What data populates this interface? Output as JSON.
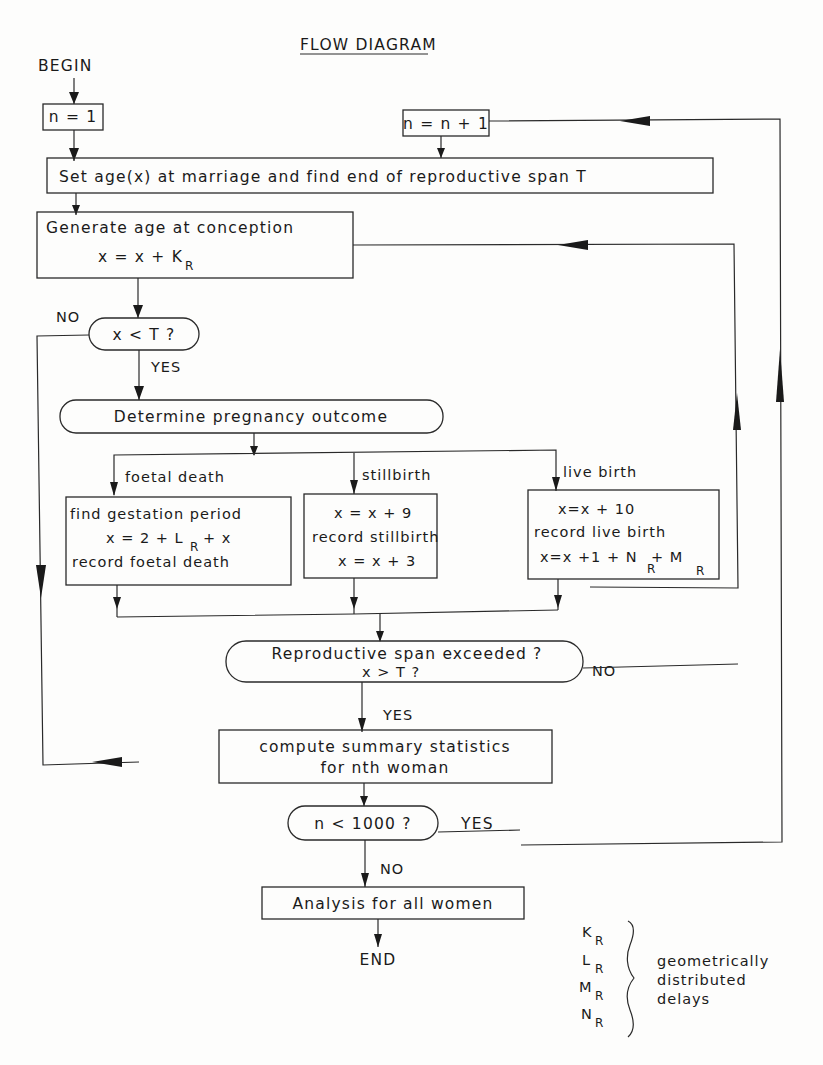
{
  "title": "FLOW DIAGRAM",
  "begin": "BEGIN",
  "end": "END",
  "nodes": {
    "init_n": "n = 1",
    "increment_n": "n = n + 1",
    "set_age": "Set age(x) at marriage and find end of reproductive span T",
    "generate_age": {
      "line1": "Generate age at conception",
      "line2": "x = x + K",
      "line2_sub": "R"
    },
    "decision_x_lt_T": "x < T ?",
    "determine_outcome": "Determine pregnancy outcome",
    "foetal_death_box": {
      "line1": "find gestation period",
      "line2a": "x = 2 + L",
      "line2_sub": "R",
      "line2b": "+ x",
      "line3": "record foetal death"
    },
    "stillbirth_box": {
      "line1": "x = x + 9",
      "line2": "record stillbirth",
      "line3": "x = x + 3"
    },
    "live_birth_box": {
      "line1": "x=x + 10",
      "line2": "record live birth",
      "line3a": "x=x +1 + N",
      "line3_sub1": "R",
      "line3b": "+ M",
      "line3_sub2": "R"
    },
    "decision_span_exceeded": {
      "line1": "Reproductive span exceeded ?",
      "line2": "x > T ?"
    },
    "summary_stats": {
      "line1": "compute summary statistics",
      "line2": "for nth woman"
    },
    "decision_n_lt_1000": "n < 1000 ?",
    "analysis_all": "Analysis for all women"
  },
  "branch_labels": {
    "foetal_death": "foetal death",
    "stillbirth": "stillbirth",
    "live_birth": "live birth",
    "x_lt_T_no": "NO",
    "x_lt_T_yes": "YES",
    "span_no": "NO",
    "span_yes": "YES",
    "n_yes": "YES",
    "n_no": "NO"
  },
  "legend": {
    "symbols": [
      {
        "letter": "K",
        "sub": "R"
      },
      {
        "letter": "L",
        "sub": "R"
      },
      {
        "letter": "M",
        "sub": "R"
      },
      {
        "letter": "N",
        "sub": "R"
      }
    ],
    "line1": "geometrically",
    "line2": "distributed",
    "line3": "delays"
  }
}
